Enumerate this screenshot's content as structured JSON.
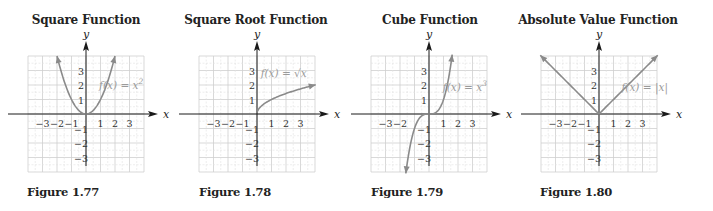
{
  "chart_data": [
    {
      "type": "line",
      "title": "Square Function",
      "figure": "Figure 1.77",
      "function_label": "f(x) = x²",
      "function": "square",
      "xlabel": "x",
      "ylabel": "y",
      "xlim": [
        -4,
        4
      ],
      "ylim": [
        -4,
        4
      ],
      "x_ticks": [
        "−3",
        "−2",
        "−1",
        "1",
        "2",
        "3"
      ],
      "y_ticks": [
        "3",
        "2",
        "1",
        "−1",
        "−2",
        "−3"
      ],
      "grid": true,
      "x": [
        -2,
        -1.5,
        -1,
        -0.5,
        0,
        0.5,
        1,
        1.5,
        2
      ],
      "y": [
        4,
        2.25,
        1,
        0.25,
        0,
        0.25,
        1,
        2.25,
        4
      ],
      "arrows": "both ends"
    },
    {
      "type": "line",
      "title": "Square Root Function",
      "figure": "Figure 1.78",
      "function_label": "f(x) = √x",
      "function": "sqrt",
      "xlabel": "x",
      "ylabel": "y",
      "xlim": [
        -4,
        4
      ],
      "ylim": [
        -4,
        4
      ],
      "x_ticks": [
        "−3",
        "−2",
        "−1",
        "1",
        "2",
        "3"
      ],
      "y_ticks": [
        "3",
        "2",
        "1",
        "−1",
        "−2",
        "−3"
      ],
      "grid": true,
      "x": [
        0,
        0.25,
        1,
        2,
        3,
        4
      ],
      "y": [
        0,
        0.5,
        1,
        1.41,
        1.73,
        2
      ],
      "arrows": "right end"
    },
    {
      "type": "line",
      "title": "Cube Function",
      "figure": "Figure 1.79",
      "function_label": "f(x) = x³",
      "function": "cube",
      "xlabel": "x",
      "ylabel": "y",
      "xlim": [
        -4,
        4
      ],
      "ylim": [
        -4,
        4
      ],
      "x_ticks": [
        "−3",
        "−2",
        "1",
        "2",
        "3"
      ],
      "y_ticks": [
        "3",
        "2",
        "1",
        "−1",
        "−2",
        "−3"
      ],
      "grid": true,
      "x": [
        -1.59,
        -1.26,
        -1,
        -0.5,
        0,
        0.5,
        1,
        1.26,
        1.59
      ],
      "y": [
        -4,
        -2,
        -1,
        -0.125,
        0,
        0.125,
        1,
        2,
        4
      ],
      "arrows": "both ends"
    },
    {
      "type": "line",
      "title": "Absolute Value Function",
      "figure": "Figure 1.80",
      "function_label": "f(x) = |x|",
      "function": "abs",
      "xlabel": "x",
      "ylabel": "y",
      "xlim": [
        -4,
        4
      ],
      "ylim": [
        -4,
        4
      ],
      "x_ticks": [
        "−3",
        "−2",
        "−1",
        "1",
        "2",
        "3"
      ],
      "y_ticks": [
        "3",
        "2",
        "1",
        "−1",
        "−2",
        "−3"
      ],
      "grid": true,
      "x": [
        -4,
        -3,
        -2,
        -1,
        0,
        1,
        2,
        3,
        4
      ],
      "y": [
        4,
        3,
        2,
        1,
        0,
        1,
        2,
        3,
        4
      ],
      "arrows": "both ends"
    }
  ],
  "panels": [
    {
      "title": "Square Function",
      "figure": "Figure 1.77",
      "flabel_main": "f(x) = x",
      "flabel_sup": "2"
    },
    {
      "title": "Square Root Function",
      "figure": "Figure 1.78",
      "flabel_main": "f(x) = √x",
      "flabel_sup": ""
    },
    {
      "title": "Cube Function",
      "figure": "Figure 1.79",
      "flabel_main": "f(x) = x",
      "flabel_sup": "3"
    },
    {
      "title": "Absolute Value Function",
      "figure": "Figure 1.80",
      "flabel_main": "f(x) = |x|",
      "flabel_sup": ""
    }
  ],
  "axis_labels": {
    "x": "x",
    "y": "y"
  },
  "colors": {
    "curve": "#8a8a8a",
    "grid": "#cfcfcf",
    "axis": "#1a1a1a",
    "label": "#9a9a9a"
  }
}
